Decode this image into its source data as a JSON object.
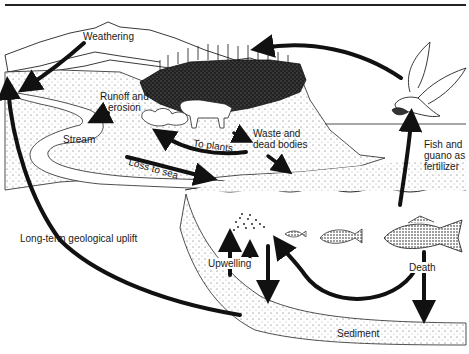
{
  "diagram": {
    "type": "phosphorus-cycle",
    "labels": {
      "weathering": "Weathering",
      "runoff": "Runoff and\nerosion",
      "stream": "Stream",
      "to_plants": "To plants",
      "waste": "Waste and\ndead bodies",
      "loss_to_sea": "Loss to sea",
      "fish_guano": "Fish and\nguano as\nfertilizer",
      "uplift": "Long-term geological uplift",
      "upwelling": "Upwelling",
      "death": "Death",
      "sediment": "Sediment"
    },
    "elements": [
      "mountains",
      "forest",
      "cow",
      "shrubs",
      "stream",
      "sea",
      "seabird",
      "plankton",
      "small-fish",
      "medium-fish",
      "large-fish",
      "sediment-layer"
    ],
    "colors": {
      "ink": "#111111",
      "paper": "#ffffff",
      "stipple": "#555555"
    }
  }
}
